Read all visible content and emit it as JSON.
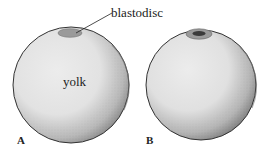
{
  "figure": {
    "callout_label": "blastodisc",
    "region_label": "yolk",
    "panels": [
      {
        "id": "A",
        "label": "A",
        "blastodisc_style": "uniform"
      },
      {
        "id": "B",
        "label": "B",
        "blastodisc_style": "dense-center"
      }
    ],
    "colors": {
      "yolk_fill": "#e4e4e4",
      "outline": "#333333",
      "blastodisc_fill": "#9a9a9a",
      "blastodisc_core": "#3a3a3a"
    }
  }
}
